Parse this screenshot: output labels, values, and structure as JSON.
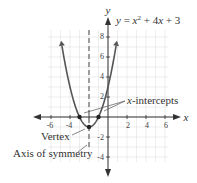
{
  "equation": {
    "lhs": "y",
    "eq": " = ",
    "x1": "x",
    "exp": "2",
    "rest1": " + 4",
    "x2": "x",
    "rest2": " + 3"
  },
  "axes": {
    "x_label": "x",
    "y_label": "y",
    "x_ticks": [
      "-6",
      "-4",
      "2",
      "4",
      "6"
    ],
    "y_ticks": [
      "8",
      "6",
      "4",
      "2",
      "-2",
      "-4"
    ]
  },
  "annotations": {
    "x_intercepts_prefix": "x",
    "x_intercepts_suffix": "-intercepts",
    "vertex": "Vertex",
    "axis_of_symmetry": "Axis of symmetry"
  },
  "points": {
    "vertex": [
      -2,
      -1
    ],
    "intercepts": [
      [
        -3,
        0
      ],
      [
        -1,
        0
      ]
    ]
  },
  "colors": {
    "curve": "#555555",
    "grid": "#dddddd",
    "axis": "#333333",
    "dashed": "#777777"
  }
}
